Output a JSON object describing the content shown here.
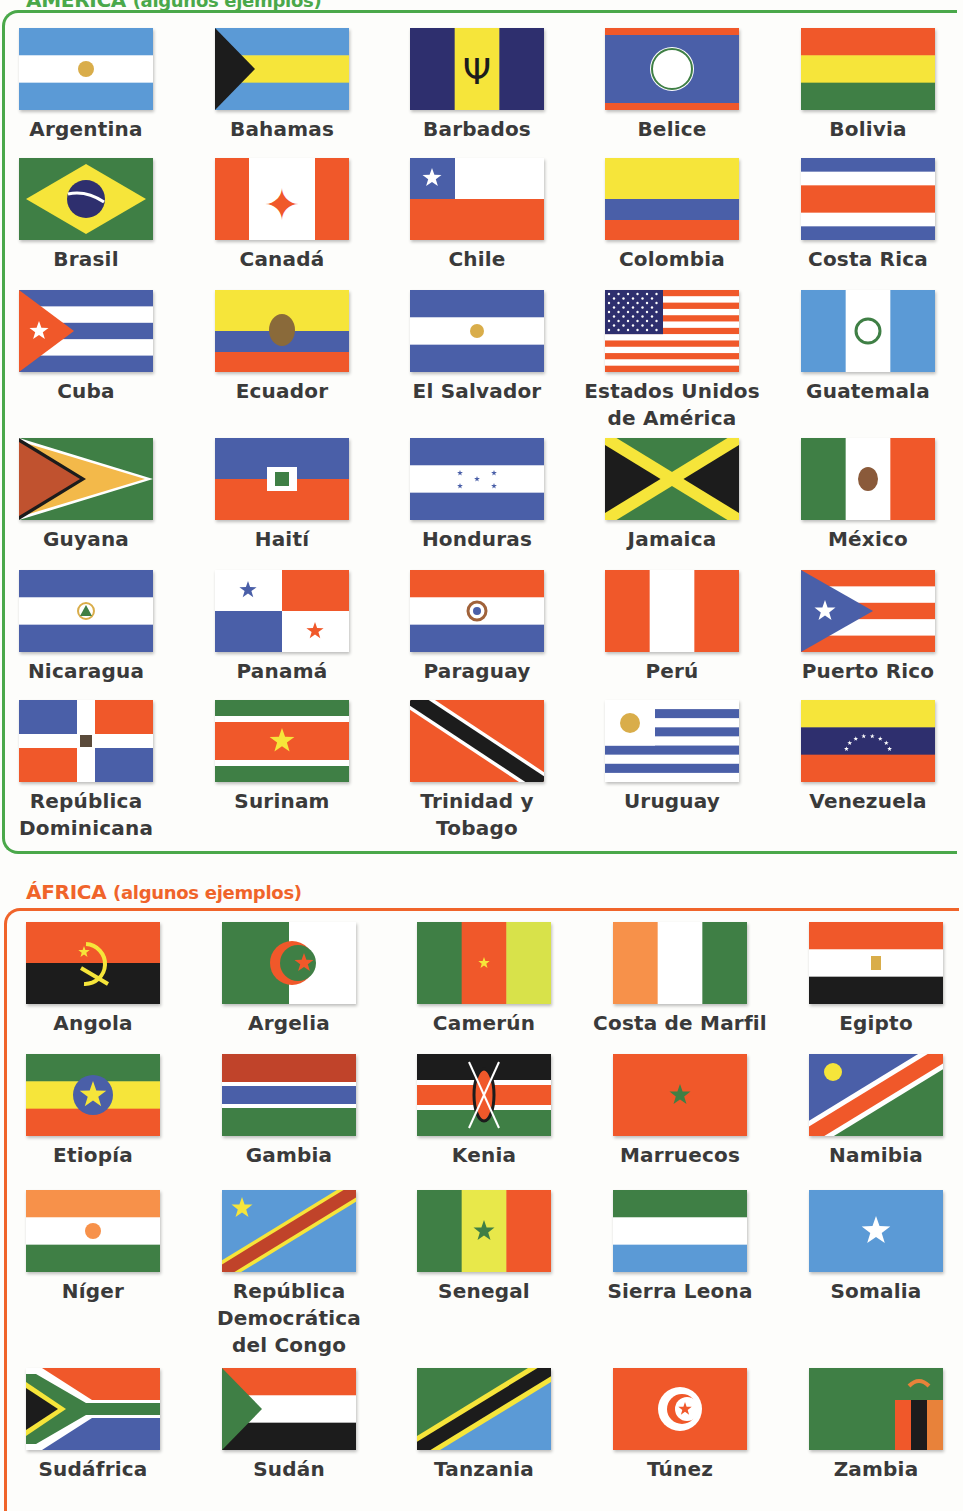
{
  "sections": {
    "america": {
      "title": "AMÉRICA",
      "subtitle": "(algunos ejemplos)",
      "color": "#4aa84a",
      "countries": [
        {
          "name": "Argentina",
          "flag": "argentina"
        },
        {
          "name": "Bahamas",
          "flag": "bahamas"
        },
        {
          "name": "Barbados",
          "flag": "barbados"
        },
        {
          "name": "Belice",
          "flag": "belize"
        },
        {
          "name": "Bolivia",
          "flag": "bolivia"
        },
        {
          "name": "Brasil",
          "flag": "brazil"
        },
        {
          "name": "Canadá",
          "flag": "canada"
        },
        {
          "name": "Chile",
          "flag": "chile"
        },
        {
          "name": "Colombia",
          "flag": "colombia"
        },
        {
          "name": "Costa Rica",
          "flag": "costa-rica"
        },
        {
          "name": "Cuba",
          "flag": "cuba"
        },
        {
          "name": "Ecuador",
          "flag": "ecuador"
        },
        {
          "name": "El Salvador",
          "flag": "el-salvador"
        },
        {
          "name": "Estados Unidos de América",
          "flag": "usa"
        },
        {
          "name": "Guatemala",
          "flag": "guatemala"
        },
        {
          "name": "Guyana",
          "flag": "guyana"
        },
        {
          "name": "Haití",
          "flag": "haiti"
        },
        {
          "name": "Honduras",
          "flag": "honduras"
        },
        {
          "name": "Jamaica",
          "flag": "jamaica"
        },
        {
          "name": "México",
          "flag": "mexico"
        },
        {
          "name": "Nicaragua",
          "flag": "nicaragua"
        },
        {
          "name": "Panamá",
          "flag": "panama"
        },
        {
          "name": "Paraguay",
          "flag": "paraguay"
        },
        {
          "name": "Perú",
          "flag": "peru"
        },
        {
          "name": "Puerto Rico",
          "flag": "puerto-rico"
        },
        {
          "name": "República Dominicana",
          "flag": "dominican-republic"
        },
        {
          "name": "Surinam",
          "flag": "suriname"
        },
        {
          "name": "Trinidad y Tobago",
          "flag": "trinidad-tobago"
        },
        {
          "name": "Uruguay",
          "flag": "uruguay"
        },
        {
          "name": "Venezuela",
          "flag": "venezuela"
        }
      ]
    },
    "africa": {
      "title": "ÁFRICA",
      "subtitle": "(algunos ejemplos)",
      "color": "#f0642a",
      "countries": [
        {
          "name": "Angola",
          "flag": "angola"
        },
        {
          "name": "Argelia",
          "flag": "algeria"
        },
        {
          "name": "Camerún",
          "flag": "cameroon"
        },
        {
          "name": "Costa de Marfil",
          "flag": "ivory-coast"
        },
        {
          "name": "Egipto",
          "flag": "egypt"
        },
        {
          "name": "Etiopía",
          "flag": "ethiopia"
        },
        {
          "name": "Gambia",
          "flag": "gambia"
        },
        {
          "name": "Kenia",
          "flag": "kenya"
        },
        {
          "name": "Marruecos",
          "flag": "morocco"
        },
        {
          "name": "Namibia",
          "flag": "namibia"
        },
        {
          "name": "Níger",
          "flag": "niger"
        },
        {
          "name": "República Democrática del Congo",
          "flag": "dr-congo"
        },
        {
          "name": "Senegal",
          "flag": "senegal"
        },
        {
          "name": "Sierra Leona",
          "flag": "sierra-leone"
        },
        {
          "name": "Somalia",
          "flag": "somalia"
        },
        {
          "name": "Sudáfrica",
          "flag": "south-africa"
        },
        {
          "name": "Sudán",
          "flag": "sudan"
        },
        {
          "name": "Tanzania",
          "flag": "tanzania"
        },
        {
          "name": "Túnez",
          "flag": "tunisia"
        },
        {
          "name": "Zambia",
          "flag": "zambia"
        }
      ]
    }
  },
  "palette": {
    "blue": "#4a5fa8",
    "lightblue": "#5b9ad6",
    "navy": "#2e2f6e",
    "red": "#f0582a",
    "green": "#3f7f45",
    "yellow": "#f6e53a",
    "white": "#ffffff",
    "black": "#1c1c1c",
    "gold": "#d9ad4a"
  }
}
